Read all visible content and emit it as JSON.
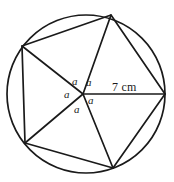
{
  "figure": {
    "type": "circle-with-inscribed-pentagon",
    "stroke_color": "#1a1a1a",
    "background_color": "#ffffff",
    "circle": {
      "center_x": 86,
      "center_y": 94,
      "radius": 79
    },
    "vertices": [
      {
        "name": "right-vertex",
        "x": 165,
        "y": 94
      },
      {
        "name": "top-vertex",
        "x": 111,
        "y": 15
      },
      {
        "name": "upper-left-vertex",
        "x": 22,
        "y": 46
      },
      {
        "name": "lower-left-vertex",
        "x": 25,
        "y": 143
      },
      {
        "name": "bottom-vertex",
        "x": 113,
        "y": 168
      }
    ],
    "center_point": {
      "x": 83,
      "y": 94
    },
    "angle_labels": [
      {
        "id": "angle-a-upper-left",
        "text": "a",
        "x": 72,
        "y": 76
      },
      {
        "id": "angle-a-upper-right",
        "text": "a",
        "x": 86,
        "y": 77
      },
      {
        "id": "angle-a-left",
        "text": "a",
        "x": 64,
        "y": 89
      },
      {
        "id": "angle-a-right",
        "text": "a",
        "x": 88,
        "y": 95
      },
      {
        "id": "angle-a-bottom",
        "text": "a",
        "x": 74,
        "y": 104
      }
    ],
    "measurements": [
      {
        "id": "radius-measure",
        "text": "7 cm",
        "x": 112,
        "y": 81
      }
    ]
  }
}
